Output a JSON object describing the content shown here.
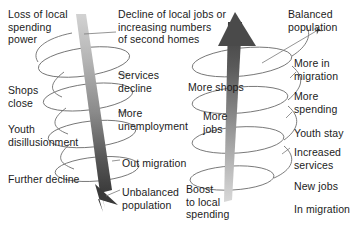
{
  "diagram": {
    "title_left": "Decline of local jobs or\nincreasing numbers\nof second homes",
    "negative_spiral": {
      "name": "downward-spiral",
      "direction": "down",
      "arrow_color_top": "#c9c9c9",
      "arrow_color_bottom": "#3a3a3a",
      "left_labels": [
        {
          "text": "Loss of local\nspending\npower",
          "x": 8,
          "y": 8
        },
        {
          "text": "Shops\nclose",
          "x": 8,
          "y": 84
        },
        {
          "text": "Youth\ndisillusionment",
          "x": 8,
          "y": 123
        },
        {
          "text": "Further decline",
          "x": 8,
          "y": 173
        }
      ],
      "right_labels": [
        {
          "text": "Services\ndecline",
          "x": 118,
          "y": 69
        },
        {
          "text": "More\nunemployment",
          "x": 118,
          "y": 107
        },
        {
          "text": "Out migration",
          "x": 122,
          "y": 157
        },
        {
          "text": "Unbalanced\npopulation",
          "x": 122,
          "y": 186
        }
      ]
    },
    "positive_spiral": {
      "name": "upward-spiral",
      "direction": "up",
      "arrow_color_top": "#3a3a3a",
      "arrow_color_bottom": "#cccccc",
      "left_labels": [
        {
          "text": "More shops",
          "x": 188,
          "y": 81
        },
        {
          "text": "More\njobs",
          "x": 203,
          "y": 110
        },
        {
          "text": "Boost\nto local\nspending",
          "x": 186,
          "y": 183
        }
      ],
      "right_labels": [
        {
          "text": "Balanced\npopulation",
          "x": 288,
          "y": 8
        },
        {
          "text": "More in\nmigration",
          "x": 294,
          "y": 57
        },
        {
          "text": "More\nspending",
          "x": 294,
          "y": 90
        },
        {
          "text": "Youth stay",
          "x": 294,
          "y": 127
        },
        {
          "text": "Increased\nservices",
          "x": 294,
          "y": 146
        },
        {
          "text": "New jobs",
          "x": 294,
          "y": 180
        },
        {
          "text": "In migration",
          "x": 294,
          "y": 203
        }
      ]
    }
  },
  "colors": {
    "text": "#1b1b1b",
    "spiral_stroke": "#6b6b6b",
    "background": "#ffffff"
  }
}
